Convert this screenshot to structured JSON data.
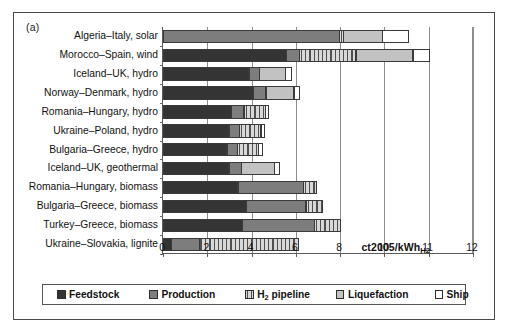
{
  "figure": {
    "panel_label": "(a)",
    "unit_annotation": "ct2005/kWh",
    "unit_annotation_sub": "H2"
  },
  "legend": {
    "items": [
      {
        "label": "Feedstock",
        "sub": "",
        "swatch": "dark-gray-square",
        "color": "#343434"
      },
      {
        "label": "Production",
        "sub": "",
        "swatch": "medium-gray-square",
        "color": "#7d7d7d"
      },
      {
        "label": " pipeline",
        "sub": "2",
        "prefix": "H",
        "swatch": "hatched-square",
        "color": "#d8d8d8"
      },
      {
        "label": "Liquefaction",
        "sub": "",
        "swatch": "light-gray-square",
        "color": "#c2c2c2"
      },
      {
        "label": "Ship",
        "sub": "",
        "swatch": "white-square",
        "color": "#ffffff"
      }
    ]
  },
  "chart_data": {
    "type": "bar",
    "orientation": "horizontal",
    "stacked": true,
    "title": "",
    "xlabel": "ct2005/kWhH2",
    "ylabel": "",
    "xlim": [
      0,
      12
    ],
    "xticks": [
      0,
      2,
      4,
      6,
      8,
      10,
      11,
      12
    ],
    "xtick_labels": [
      "0",
      "2",
      "4",
      "6",
      "8",
      "10",
      "11",
      "12"
    ],
    "grid": "vertical",
    "legend_position": "bottom",
    "series": [
      {
        "name": "Feedstock",
        "values": [
          0.0,
          5.6,
          3.9,
          4.1,
          3.1,
          3.0,
          2.9,
          3.0,
          3.4,
          3.8,
          3.6,
          0.4
        ]
      },
      {
        "name": "Production",
        "values": [
          8.0,
          0.6,
          0.5,
          0.6,
          0.6,
          0.5,
          0.5,
          0.6,
          3.0,
          2.7,
          3.3,
          1.3
        ]
      },
      {
        "name": "H2 pipeline",
        "values": [
          0.2,
          2.6,
          0.0,
          0.0,
          1.0,
          1.0,
          1.0,
          0.0,
          0.6,
          0.8,
          1.2,
          4.5
        ]
      },
      {
        "name": "Liquefaction",
        "values": [
          1.8,
          1.9,
          1.2,
          1.3,
          0.0,
          0.0,
          0.0,
          1.5,
          0.0,
          0.0,
          0.0,
          0.0
        ]
      },
      {
        "name": "Ship",
        "values": [
          0.6,
          0.4,
          0.3,
          0.3,
          0.2,
          0.2,
          0.2,
          0.3,
          0.0,
          0.0,
          0.0,
          0.0
        ]
      }
    ],
    "categories": [
      "Algeria–Italy, solar",
      "Morocco–Spain, wind",
      "Iceland–UK, hydro",
      "Norway–Denmark, hydro",
      "Romania–Hungary, hydro",
      "Ukraine–Poland, hydro",
      "Bulgaria–Greece, hydro",
      "Iceland–UK, geothermal",
      "Romania–Hungary, biomass",
      "Bulgaria–Greece, biomass",
      "Turkey–Greece, biomass",
      "Ukraine–Slovakia, lignite"
    ],
    "totals": [
      10.6,
      11.1,
      5.9,
      6.3,
      4.9,
      4.7,
      4.6,
      5.4,
      7.0,
      7.3,
      8.1,
      6.2
    ]
  }
}
